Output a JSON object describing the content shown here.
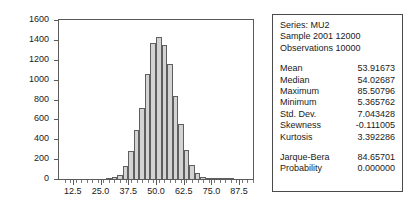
{
  "chart_data": {
    "type": "bar",
    "title": "",
    "subtitle": "",
    "xlabel": "",
    "ylabel": "",
    "grid": false,
    "legend": "none",
    "xlim": [
      6.25,
      93.75
    ],
    "ylim": [
      0,
      1600
    ],
    "bin_width": 2.5,
    "x_tick_labels": [
      "12.5",
      "25.0",
      "37.5",
      "50.0",
      "62.5",
      "75.0",
      "87.5"
    ],
    "x_tick_values": [
      12.5,
      25.0,
      37.5,
      50.0,
      62.5,
      75.0,
      87.5
    ],
    "y_tick_labels": [
      "0",
      "200",
      "400",
      "600",
      "800",
      "1000",
      "1200",
      "1400",
      "1600"
    ],
    "y_tick_values": [
      0,
      200,
      400,
      600,
      800,
      1000,
      1200,
      1400,
      1600
    ],
    "bin_centers": [
      28.75,
      31.25,
      33.75,
      36.25,
      38.75,
      41.25,
      43.75,
      46.25,
      48.75,
      51.25,
      53.75,
      56.25,
      58.75,
      61.25,
      63.75,
      66.25,
      68.75,
      71.25,
      73.75,
      76.25,
      78.75,
      81.25,
      83.75
    ],
    "categories": [
      "28.75",
      "31.25",
      "33.75",
      "36.25",
      "38.75",
      "41.25",
      "43.75",
      "46.25",
      "48.75",
      "51.25",
      "53.75",
      "56.25",
      "58.75",
      "61.25",
      "63.75",
      "66.25",
      "68.75",
      "71.25",
      "73.75",
      "76.25",
      "78.75",
      "81.25",
      "83.75"
    ],
    "values": [
      8,
      20,
      45,
      135,
      280,
      490,
      715,
      1055,
      1370,
      1425,
      1345,
      1155,
      840,
      550,
      290,
      140,
      60,
      25,
      12,
      6,
      3,
      2,
      1
    ],
    "bar_fill_color": "#d3d3d3",
    "bar_edge_color": "#5f5f5f",
    "axis_color": "#5a5a5a",
    "background_color": "#ffffff"
  },
  "stats_panel": {
    "series_line": "Series: MU2",
    "sample_line": "Sample 2001 12000",
    "observations_line": "Observations 10000",
    "rows": [
      {
        "label": "Mean",
        "value": "53.91673"
      },
      {
        "label": "Median",
        "value": "54.02687"
      },
      {
        "label": "Maximum",
        "value": "85.50796"
      },
      {
        "label": "Minimum",
        "value": "5.365762"
      },
      {
        "label": "Std. Dev.",
        "value": "7.043428"
      },
      {
        "label": "Skewness",
        "value": "-0.111005"
      },
      {
        "label": "Kurtosis",
        "value": "3.392286"
      }
    ],
    "test_rows": [
      {
        "label": "Jarque-Bera",
        "value": "84.65701"
      },
      {
        "label": "Probability",
        "value": "0.000000"
      }
    ]
  }
}
